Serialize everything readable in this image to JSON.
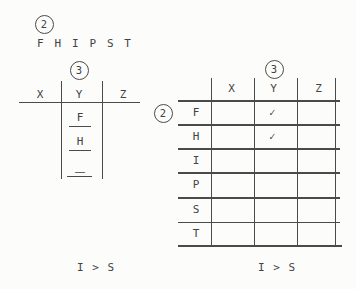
{
  "colors": {
    "ink": "#4a4a4a",
    "paper": "#fcfcfb"
  },
  "badges": {
    "left_step": "2",
    "left_col": "3",
    "right_step": "2",
    "right_col": "3"
  },
  "letters": [
    "F",
    "H",
    "I",
    "P",
    "S",
    "T"
  ],
  "left_table": {
    "headers": [
      "X",
      "Y",
      "Z"
    ],
    "y_slots": [
      "F",
      "H",
      "—"
    ]
  },
  "left_caption": "I > S",
  "right_table": {
    "headers": [
      "X",
      "Y",
      "Z"
    ],
    "rows": [
      {
        "label": "F",
        "y_mark": "✓"
      },
      {
        "label": "H",
        "y_mark": "✓"
      },
      {
        "label": "I",
        "y_mark": ""
      },
      {
        "label": "P",
        "y_mark": ""
      },
      {
        "label": "S",
        "y_mark": ""
      },
      {
        "label": "T",
        "y_mark": ""
      }
    ]
  },
  "right_caption": "I > S"
}
